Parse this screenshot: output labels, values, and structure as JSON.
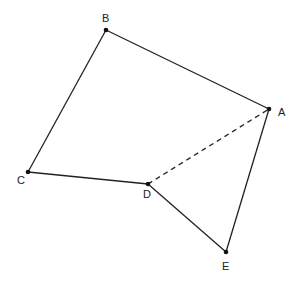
{
  "diagram": {
    "type": "polygon",
    "points": [
      {
        "id": "A",
        "label": "A",
        "x": 269,
        "y": 109,
        "lx": 278,
        "ly": 116
      },
      {
        "id": "B",
        "label": "B",
        "x": 106,
        "y": 30,
        "lx": 102,
        "ly": 22
      },
      {
        "id": "C",
        "label": "C",
        "x": 28,
        "y": 172,
        "lx": 17,
        "ly": 184
      },
      {
        "id": "D",
        "label": "D",
        "x": 148,
        "y": 184,
        "lx": 143,
        "ly": 198
      },
      {
        "id": "E",
        "label": "E",
        "x": 226,
        "y": 252,
        "lx": 222,
        "ly": 270
      }
    ],
    "solid_edges": [
      [
        "B",
        "A"
      ],
      [
        "B",
        "C"
      ],
      [
        "C",
        "D"
      ],
      [
        "D",
        "E"
      ],
      [
        "E",
        "A"
      ]
    ],
    "dashed_edges": [
      [
        "D",
        "A"
      ]
    ],
    "colors": {
      "line": "#222222",
      "point": "#111111",
      "label": "#222222"
    }
  }
}
